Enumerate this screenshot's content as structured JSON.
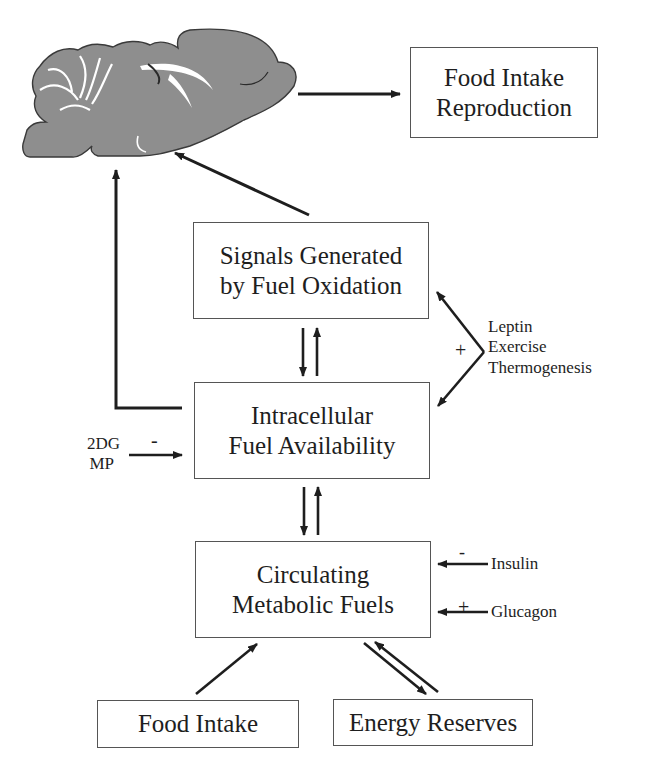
{
  "figure": {
    "brain": {
      "label": "brain-sagittal-section",
      "fill": "#8e8e8e",
      "outline": "#3a3a3a"
    },
    "boxes": {
      "outputs": {
        "line1": "Food Intake",
        "line2": "Reproduction"
      },
      "signals": {
        "line1": "Signals Generated",
        "line2": "by Fuel Oxidation"
      },
      "intracellular": {
        "line1": "Intracellular",
        "line2": "Fuel Availability"
      },
      "circulating": {
        "line1": "Circulating",
        "line2": "Metabolic Fuels"
      },
      "food_intake": {
        "label": "Food Intake"
      },
      "energy_reserves": {
        "label": "Energy Reserves"
      }
    },
    "modulators": {
      "oxidation_effectors": {
        "sign": "+",
        "items": [
          "Leptin",
          "Exercise",
          "Thermogenesis"
        ]
      },
      "inhibitors": {
        "sign": "-",
        "items": [
          "2DG",
          "MP"
        ]
      },
      "insulin": {
        "sign": "-",
        "label": "Insulin"
      },
      "glucagon": {
        "sign": "+",
        "label": "Glucagon"
      }
    },
    "colors": {
      "ink": "#1e1e1e",
      "box_border": "#555555",
      "background": "#ffffff"
    }
  }
}
